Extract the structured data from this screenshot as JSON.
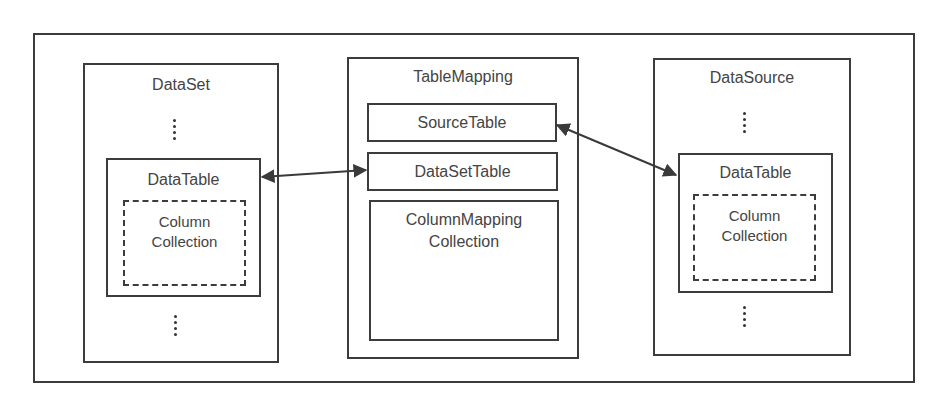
{
  "diagram": {
    "dataset": {
      "title": "DataSet",
      "datatable": {
        "title": "DataTable",
        "column_collection": "Column\nCollection",
        "column_line1": "Column",
        "column_line2": "Collection"
      }
    },
    "tablemapping": {
      "title": "TableMapping",
      "source_table": "SourceTable",
      "dataset_table": "DataSetTable",
      "column_mapping_line1": "ColumnMapping",
      "column_mapping_line2": "Collection"
    },
    "datasource": {
      "title": "DataSource",
      "datatable": {
        "title": "DataTable",
        "column_line1": "Column",
        "column_line2": "Collection"
      }
    },
    "connections": [
      {
        "from": "DataSet.DataTable",
        "to": "TableMapping.DataSetTable",
        "type": "bidirectional"
      },
      {
        "from": "TableMapping.SourceTable",
        "to": "DataSource.DataTable",
        "type": "bidirectional"
      }
    ],
    "colors": {
      "stroke": "#3c3c3c",
      "text": "#444444",
      "background": "#ffffff"
    }
  }
}
